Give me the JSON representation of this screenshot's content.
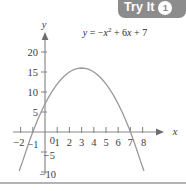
{
  "badge": {
    "label": "Try It",
    "number": "1",
    "bg_color": "#8c8c8c",
    "text_color": "#ffffff"
  },
  "figure": {
    "equation_label": "y = −x² + 6x + 7",
    "x_axis_name": "x",
    "y_axis_name": "y",
    "curve_color": "#999999",
    "axis_color": "#808080",
    "text_color": "#404040"
  },
  "chart_data": {
    "type": "line",
    "title": "",
    "annotations": [
      "y = −x² + 6x + 7"
    ],
    "xlabel": "x",
    "ylabel": "y",
    "xlim": [
      -2.4,
      8.6
    ],
    "ylim": [
      -11.5,
      22.5
    ],
    "grid": false,
    "legend": "none",
    "x_ticks": [
      -2,
      -1,
      0,
      1,
      2,
      3,
      4,
      5,
      6,
      7,
      8
    ],
    "x_tick_labels": [
      "−2",
      "−1",
      "0",
      "1",
      "2",
      "3",
      "4",
      "5",
      "6",
      "7",
      "8"
    ],
    "y_ticks": [
      -10,
      -5,
      0,
      5,
      10,
      15,
      20
    ],
    "y_tick_labels": [
      "−10",
      "−5",
      "0",
      "5",
      "10",
      "15",
      "20"
    ],
    "function": "y = -x^2 + 6x + 7",
    "vertex": [
      3,
      16
    ],
    "roots": [
      -1,
      7
    ],
    "y_intercept": 7,
    "series": [
      {
        "name": "y = -x^2 + 6x + 7",
        "x": [
          -2.1,
          -1.8,
          -1.5,
          -1.2,
          -0.9,
          -0.6,
          -0.3,
          0,
          0.3,
          0.6,
          0.9,
          1.2,
          1.5,
          1.8,
          2.1,
          2.4,
          2.7,
          3,
          3.3,
          3.6,
          3.9,
          4.2,
          4.5,
          4.8,
          5.1,
          5.4,
          5.7,
          6,
          6.3,
          6.6,
          6.9,
          7.2,
          7.5,
          7.8,
          8.1
        ],
        "values": [
          -9.61,
          -7.04,
          -4.25,
          -1.64,
          0.79,
          3.04,
          5.11,
          7,
          8.71,
          10.24,
          11.59,
          12.76,
          13.75,
          14.56,
          15.19,
          15.64,
          15.91,
          16,
          15.91,
          15.64,
          15.19,
          14.56,
          13.75,
          12.76,
          11.59,
          10.24,
          8.71,
          7,
          5.11,
          3.04,
          0.79,
          -1.64,
          -4.25,
          -7.04,
          -9.61
        ]
      }
    ]
  }
}
